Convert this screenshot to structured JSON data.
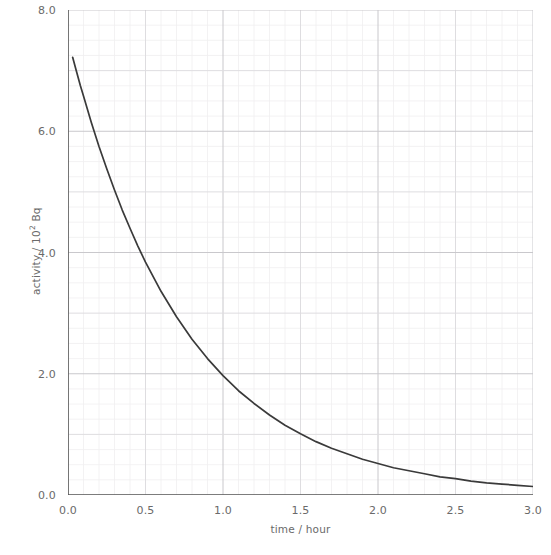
{
  "chart_data": {
    "type": "line",
    "title": "",
    "xlabel": "time / hour",
    "ylabel_prefix": "activity / 10",
    "ylabel_exponent": "2",
    "ylabel_suffix": " Bq",
    "ylabel_full": "activity / 10² Bq",
    "xlim": [
      0.0,
      3.0
    ],
    "ylim": [
      0.0,
      8.0
    ],
    "x_tick_labels": [
      "0.0",
      "0.5",
      "1.0",
      "1.5",
      "2.0",
      "2.5",
      "3.0"
    ],
    "x_tick_values": [
      0.0,
      0.5,
      1.0,
      1.5,
      2.0,
      2.5,
      3.0
    ],
    "y_tick_labels": [
      "0.0",
      "2.0",
      "4.0",
      "6.0",
      "8.0"
    ],
    "y_tick_values": [
      0.0,
      2.0,
      4.0,
      6.0,
      8.0
    ],
    "y_minor_tick_values": [
      1.0,
      3.0,
      5.0,
      7.0
    ],
    "grid": true,
    "grid_minor_x_step": 0.1,
    "grid_minor_y_step": 0.25,
    "grid_major_x_step": 0.5,
    "grid_major_y_step": 1.0,
    "legend": null,
    "curve_color": "#3a3a3a",
    "axis_color": "#595959",
    "label_color": "#6a6a6a",
    "grid_minor_color": "#f0eff0",
    "grid_major_color": "#dedde0",
    "background": "#ffffff",
    "model": "exponential_decay",
    "model_A0": 7.52,
    "model_decay_constant": 1.34,
    "model_half_life_hours": 0.517,
    "x_start": 0.03,
    "series": [
      {
        "name": "activity",
        "x": [
          0.03,
          0.05,
          0.08,
          0.1,
          0.15,
          0.2,
          0.25,
          0.3,
          0.35,
          0.4,
          0.45,
          0.5,
          0.6,
          0.7,
          0.8,
          0.9,
          1.0,
          1.1,
          1.2,
          1.3,
          1.4,
          1.5,
          1.6,
          1.7,
          1.8,
          1.9,
          2.0,
          2.1,
          2.2,
          2.3,
          2.4,
          2.5,
          2.6,
          2.7,
          2.8,
          2.9,
          3.0
        ],
        "y": [
          7.22,
          7.03,
          6.75,
          6.58,
          6.15,
          5.75,
          5.38,
          5.03,
          4.7,
          4.4,
          4.11,
          3.84,
          3.36,
          2.94,
          2.57,
          2.25,
          1.97,
          1.72,
          1.51,
          1.32,
          1.15,
          1.01,
          0.88,
          0.77,
          0.68,
          0.59,
          0.52,
          0.45,
          0.4,
          0.35,
          0.3,
          0.27,
          0.23,
          0.2,
          0.18,
          0.16,
          0.14
        ]
      }
    ]
  }
}
